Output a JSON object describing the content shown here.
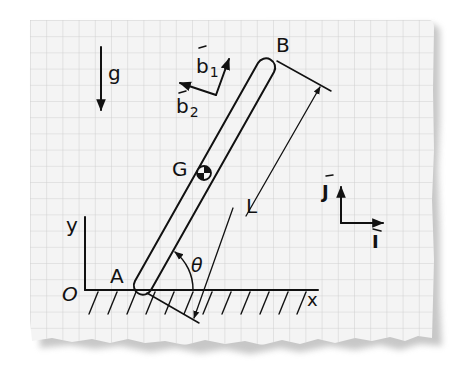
{
  "diagram": {
    "colors": {
      "paper": "#f4f4f4",
      "grid": "#cfcfcf",
      "ink": "#111111",
      "shadow": "#9a9a9a"
    },
    "labels": {
      "gravity": "g",
      "b1": "b",
      "b1_sub": "1",
      "b2": "b",
      "b2_sub": "2",
      "point_b": "B",
      "point_a": "A",
      "point_g": "G",
      "origin": "O",
      "length": "L",
      "angle": "θ",
      "axis_x": "x",
      "axis_y": "y",
      "unit_j": "J",
      "unit_i": "I"
    },
    "icons": {
      "center_of_mass": "center-of-mass-icon",
      "vector_arrow": "vector-arrow-icon"
    }
  }
}
